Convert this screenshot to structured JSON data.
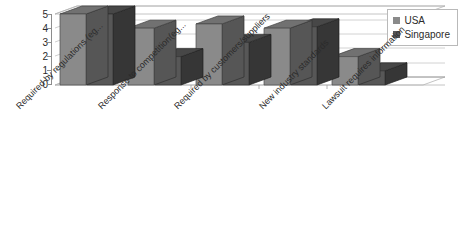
{
  "chart_data": {
    "type": "bar",
    "title": "",
    "subtitle": "",
    "xlabel": "",
    "ylabel": "",
    "ylim": [
      0,
      5
    ],
    "ytick_labels": [
      "5",
      "4",
      "3",
      "2",
      "1",
      "0"
    ],
    "ytick_values": [
      5,
      4,
      3,
      2,
      1,
      0
    ],
    "grid": true,
    "legend_position": "top-right",
    "three_d": true,
    "categories": [
      "Required by regulations (eg...",
      "Response to competition(eg...",
      "Required by customers/suppliers",
      "New industry standards",
      "Lawsuit requires information"
    ],
    "series": [
      {
        "name": "USA",
        "color": "#8a8a8a",
        "values": [
          5.0,
          4.0,
          4.3,
          4.0,
          2.0
        ]
      },
      {
        "name": "Singapore",
        "color": "#575757",
        "values": [
          5.0,
          2.0,
          3.0,
          4.1,
          1.0
        ]
      }
    ]
  },
  "legend": {
    "items": [
      {
        "label": "USA",
        "color": "#8a8a8a"
      },
      {
        "label": "Singapore",
        "color": "#575757"
      }
    ]
  }
}
